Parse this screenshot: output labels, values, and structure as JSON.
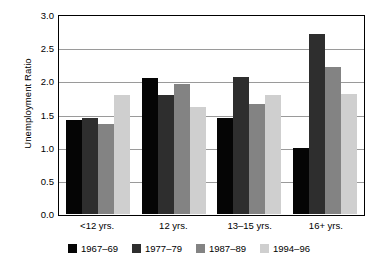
{
  "chart_data": {
    "type": "bar",
    "title": "",
    "xlabel": "",
    "ylabel": "Unemployment Ratio",
    "ylim": [
      0.0,
      3.0
    ],
    "ytick_labels": [
      "0.0",
      "0.5",
      "1.0",
      "1.5",
      "2.0",
      "2.5",
      "3.0"
    ],
    "ytick_values": [
      0.0,
      0.5,
      1.0,
      1.5,
      2.0,
      2.5,
      3.0
    ],
    "grid": true,
    "legend_position": "bottom",
    "categories": [
      "<12 yrs.",
      "12 yrs.",
      "13–15 yrs.",
      "16+ yrs."
    ],
    "series": [
      {
        "name": "1967–69",
        "color": "#050505",
        "values": [
          1.42,
          2.05,
          1.44,
          1.0
        ]
      },
      {
        "name": "1977–79",
        "color": "#2e2e2e",
        "values": [
          1.45,
          1.8,
          2.07,
          2.72
        ]
      },
      {
        "name": "1987–89",
        "color": "#838383",
        "values": [
          1.35,
          1.96,
          1.66,
          2.21
        ]
      },
      {
        "name": "1994–96",
        "color": "#cfcfcf",
        "values": [
          1.8,
          1.62,
          1.79,
          1.81
        ]
      }
    ]
  }
}
